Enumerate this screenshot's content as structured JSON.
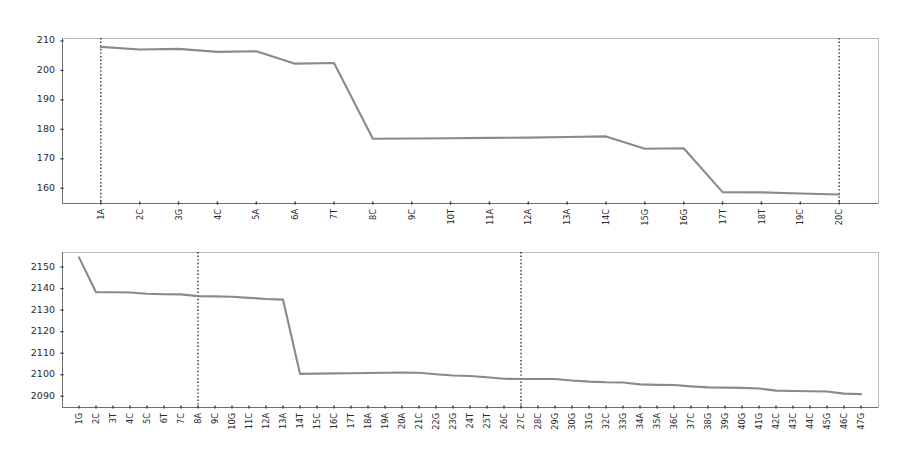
{
  "page": {
    "background": "#ffffff",
    "width": 914,
    "height": 463
  },
  "style": {
    "line_color": "#8a8a8a",
    "marker_color": "#1a1a1a",
    "frame_color": "#b9b9b9",
    "axis_color": "#6f6f6f",
    "text_color": "#2b2b2b"
  },
  "chart_data": [
    {
      "id": "top-chart",
      "type": "line",
      "title": "",
      "xlabel": "",
      "ylabel": "",
      "grid": false,
      "legend": null,
      "ylim": [
        155,
        211
      ],
      "yticks": [
        160,
        170,
        180,
        190,
        200,
        210
      ],
      "ytick_labels": [
        "160",
        "170",
        "180",
        "190",
        "200",
        "210"
      ],
      "categories": [
        "1A",
        "2C",
        "3G",
        "4C",
        "5A",
        "6A",
        "7T",
        "8C",
        "9C",
        "10T",
        "11A",
        "12A",
        "13A",
        "14C",
        "15G",
        "16G",
        "17T",
        "18T",
        "19C",
        "20C"
      ],
      "values": [
        208.0,
        207.1,
        207.3,
        206.3,
        206.5,
        202.3,
        202.5,
        176.8,
        176.9,
        177.0,
        177.1,
        177.2,
        177.4,
        177.6,
        173.4,
        173.6,
        158.7,
        158.6,
        158.2,
        157.9
      ],
      "markers": [
        {
          "category": "1A",
          "style": "dotted"
        },
        {
          "category": "20C",
          "style": "dotted"
        }
      ]
    },
    {
      "id": "bottom-chart",
      "type": "line",
      "title": "",
      "xlabel": "",
      "ylabel": "",
      "grid": false,
      "legend": null,
      "ylim": [
        2085,
        2157
      ],
      "yticks": [
        2090,
        2100,
        2110,
        2120,
        2130,
        2140,
        2150
      ],
      "ytick_labels": [
        "2090",
        "2100",
        "2110",
        "2120",
        "2130",
        "2140",
        "2150"
      ],
      "categories": [
        "1G",
        "2C",
        "3T",
        "4C",
        "5C",
        "6T",
        "7C",
        "8A",
        "9C",
        "10G",
        "11C",
        "12A",
        "13A",
        "14T",
        "15C",
        "16C",
        "17T",
        "18A",
        "19A",
        "20A",
        "21C",
        "22G",
        "23G",
        "24T",
        "25T",
        "26C",
        "27C",
        "28C",
        "29G",
        "30G",
        "31G",
        "32C",
        "33G",
        "34A",
        "35A",
        "36C",
        "37C",
        "38G",
        "39G",
        "40G",
        "41G",
        "42C",
        "43C",
        "44C",
        "45G",
        "46C",
        "47G"
      ],
      "values": [
        2154.5,
        2138.3,
        2138.3,
        2138.2,
        2137.6,
        2137.4,
        2137.3,
        2136.5,
        2136.4,
        2136.2,
        2135.7,
        2135.2,
        2134.9,
        2100.4,
        2100.5,
        2100.6,
        2100.7,
        2100.8,
        2100.9,
        2101.0,
        2100.9,
        2100.2,
        2099.6,
        2099.4,
        2098.8,
        2098.1,
        2098.0,
        2098.0,
        2098.0,
        2097.3,
        2096.8,
        2096.5,
        2096.4,
        2095.5,
        2095.3,
        2095.2,
        2094.6,
        2094.1,
        2094.0,
        2093.9,
        2093.6,
        2092.6,
        2092.4,
        2092.3,
        2092.2,
        2091.2,
        2091.0
      ],
      "markers": [
        {
          "category": "8A",
          "style": "dotted"
        },
        {
          "category": "27C",
          "style": "dotted"
        }
      ]
    }
  ]
}
